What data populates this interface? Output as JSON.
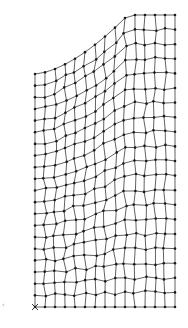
{
  "diagram": {
    "type": "finite-element-mesh",
    "colors": {
      "edge": "#3a3a3a",
      "node": "#1a1a1a",
      "background": "#ffffff"
    },
    "domain": {
      "left_x": 35,
      "right_x": 175,
      "bottom_y": 307,
      "left_top_y": 74,
      "right_top_y": 15,
      "top_left_x": 128,
      "arc_center": [
        35,
        15
      ],
      "arc_note": "concave curved boundary from (35,74) to (128,15)"
    },
    "grid": {
      "columns": 14,
      "rows": 20
    },
    "origin_marker": {
      "x": 35,
      "y": 307,
      "glyph": "x"
    },
    "axis_hint": {
      "x": 3,
      "y": 307,
      "glyph": "‹"
    }
  }
}
